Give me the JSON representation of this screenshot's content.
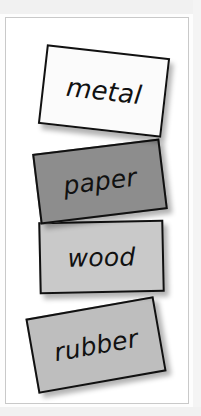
{
  "panel": {
    "background_color": "#ffffff",
    "border_color": "#c9c9c9"
  },
  "cards": [
    {
      "id": "metal",
      "label": "metal",
      "fill_color": "#fbfbfb",
      "border_color": "#111111",
      "rotation_deg": 6.5
    },
    {
      "id": "paper",
      "label": "paper",
      "fill_color": "#8d8d8d",
      "border_color": "#111111",
      "rotation_deg": -7
    },
    {
      "id": "wood",
      "label": "wood",
      "fill_color": "#c9c9c9",
      "border_color": "#111111",
      "rotation_deg": -1.2
    },
    {
      "id": "rubber",
      "label": "rubber",
      "fill_color": "#bebebe",
      "border_color": "#111111",
      "rotation_deg": -10
    }
  ]
}
